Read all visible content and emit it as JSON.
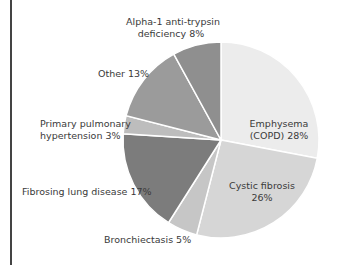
{
  "chart_data": {
    "type": "pie",
    "title": "",
    "start_angle_deg": 0,
    "direction": "clockwise",
    "slices": [
      {
        "label": "Emphysema (COPD)",
        "value": 28,
        "color": "#ececec"
      },
      {
        "label": "Cystic fibrosis",
        "value": 26,
        "color": "#d6d6d6"
      },
      {
        "label": "Bronchiectasis",
        "value": 5,
        "color": "#c6c6c6"
      },
      {
        "label": "Fibrosing lung disease",
        "value": 17,
        "color": "#7c7c7c"
      },
      {
        "label": "Primary pulmonary hypertension",
        "value": 3,
        "color": "#bdbdbd"
      },
      {
        "label": "Other",
        "value": 13,
        "color": "#9b9b9b"
      },
      {
        "label": "Alpha-1 anti-trypsin deficiency",
        "value": 8,
        "color": "#8f8f8f"
      }
    ]
  },
  "labels": {
    "emphysema_l1": "Emphysema",
    "emphysema_l2": "(COPD) 28%",
    "cystic_l1": "Cystic fibrosis",
    "cystic_l2": "26%",
    "bronchiectasis": "Bronchiectasis 5%",
    "fibrosing": "Fibrosing lung disease 17%",
    "primary_l1": "Primary pulmonary",
    "primary_l2": "hypertension 3%",
    "other": "Other 13%",
    "alpha_l1": "Alpha-1 anti-trypsin",
    "alpha_l2": "deficiency 8%"
  }
}
